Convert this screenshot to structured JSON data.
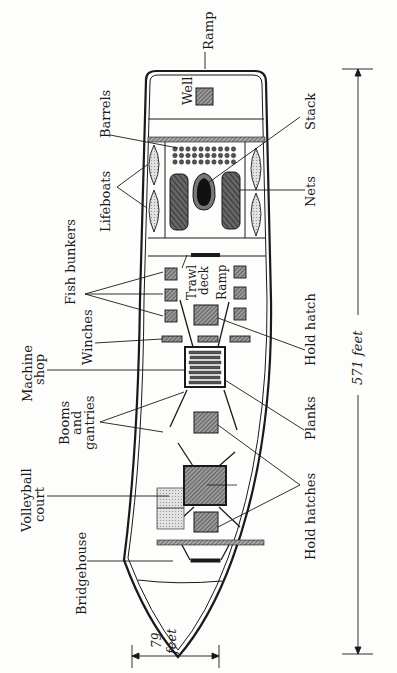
{
  "diagram": {
    "type": "ship deck plan (top view)",
    "orientation": "bow pointing down, stern at top; labels rotated 90°",
    "colors": {
      "ink": "#1a1a1a",
      "hatch_fill": "#8a8a8a",
      "light_fill": "#d6d6d6",
      "stack_fill": "#111111",
      "background": "#fdfdfb"
    },
    "labels": {
      "ramp_top": "Ramp",
      "well": "Well",
      "barrels": "Barrels",
      "stack": "Stack",
      "lifeboats": "Lifeboats",
      "nets": "Nets",
      "fish_bunkers": "Fish bunkers",
      "trawl": "Trawl",
      "deck": "deck",
      "ramp_mid": "Ramp",
      "hold_hatch": "Hold hatch",
      "winches": "Winches",
      "machine": "Machine",
      "shop": "shop",
      "booms": "Booms",
      "and": "and",
      "gantries": "gantries",
      "planks": "Planks",
      "volleyball": "Volleyball",
      "court": "court",
      "hold_hatches": "Hold hatches",
      "bridgehouse": "Bridgehouse"
    },
    "dimensions": {
      "length": {
        "value": "571",
        "unit": "feet",
        "label": "571 feet"
      },
      "beam": {
        "value": "79",
        "unit": "feet",
        "value_label": "79",
        "unit_label": "feet"
      }
    }
  }
}
